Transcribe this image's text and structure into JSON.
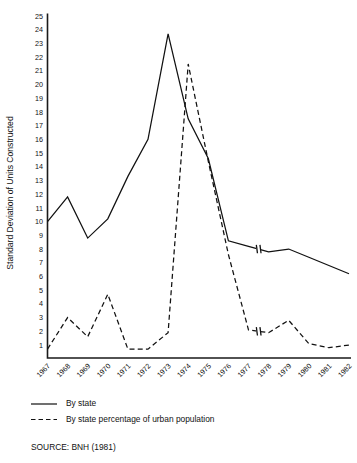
{
  "chart_data": {
    "type": "line",
    "title": "",
    "xlabel": "",
    "ylabel": "Standard Deviation of Units Constructed",
    "x": [
      "1967",
      "1968",
      "1969",
      "1970",
      "1971",
      "1972",
      "1973",
      "1974",
      "1975",
      "1976",
      "1977",
      "1978",
      "1979",
      "1980",
      "1981",
      "1982"
    ],
    "categories": [
      "1967",
      "1968",
      "1969",
      "1970",
      "1971",
      "1972",
      "1973",
      "1974",
      "1975",
      "1976",
      "1977",
      "1978",
      "1979",
      "1980",
      "1981",
      "1982"
    ],
    "ylim": [
      1,
      25
    ],
    "xlim": [
      "1967",
      "1982"
    ],
    "grid": false,
    "yticks": [
      25,
      24,
      23,
      22,
      21,
      20,
      19,
      18,
      17,
      16,
      15,
      14,
      13,
      12,
      11,
      10,
      9,
      8,
      7,
      6,
      5,
      4,
      3,
      2,
      1
    ],
    "ytick_labels": [
      "25",
      "24",
      "23",
      "22",
      "21",
      "20",
      "19",
      "18",
      "17",
      "16",
      "15",
      "14",
      "13",
      "12",
      "11",
      "10",
      "9",
      "8",
      "7",
      "6",
      "5",
      "4",
      "3",
      "2",
      "1"
    ],
    "legend_position": "below-axes-left",
    "axis_break": {
      "present": true,
      "between": [
        "1977",
        "1978"
      ],
      "note": "double slash break mark drawn on both series between 1977 and 1978"
    },
    "series": [
      {
        "name": "By state",
        "style": "solid",
        "values": [
          10.0,
          11.8,
          8.8,
          10.2,
          13.3,
          16.0,
          23.7,
          17.5,
          14.6,
          8.6,
          8.2,
          7.8,
          8.0,
          7.4,
          6.8,
          6.2
        ]
      },
      {
        "name": "By state percentage of urban population",
        "style": "dashed",
        "values": [
          0.7,
          3.0,
          1.6,
          4.7,
          0.7,
          0.7,
          1.9,
          21.5,
          14.4,
          7.6,
          2.1,
          1.9,
          2.8,
          1.1,
          0.8,
          1.0
        ]
      }
    ]
  },
  "legend": {
    "items": [
      {
        "label": "By state",
        "style": "solid"
      },
      {
        "label": "By state percentage of urban population",
        "style": "dashed"
      }
    ]
  },
  "source": {
    "text": "SOURCE: BNH (1981)"
  }
}
